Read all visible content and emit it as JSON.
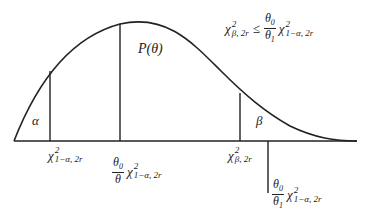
{
  "diagram": {
    "type": "probability-density-curve",
    "curve_label": "P(θ)",
    "regions": {
      "left_tail": "α",
      "right_tail": "β"
    },
    "condition": {
      "lhs_base": "χ",
      "lhs_sup": "2",
      "lhs_sub": "β, 2r",
      "operator": "≤",
      "frac_num": "θ",
      "frac_num_sub": "0",
      "frac_den": "θ",
      "frac_den_sub": "1",
      "rhs_base": "χ",
      "rhs_sup": "2",
      "rhs_sub": "1−α, 2r"
    },
    "axis_labels": [
      {
        "id": "chi-1-alpha",
        "base": "χ",
        "sup": "2",
        "sub": "1−α, 2r"
      },
      {
        "id": "theta0-over-theta-chi",
        "frac_num": "θ",
        "frac_num_sub": "0",
        "frac_den": "θ",
        "frac_den_sub": "",
        "base": "χ",
        "sup": "2",
        "sub": "1−α, 2r"
      },
      {
        "id": "chi-beta",
        "base": "χ",
        "sup": "2",
        "sub": "β, 2r"
      },
      {
        "id": "theta0-over-theta1-chi",
        "frac_num": "θ",
        "frac_num_sub": "0",
        "frac_den": "θ",
        "frac_den_sub": "1",
        "base": "χ",
        "sup": "2",
        "sub": "1−α, 2r"
      }
    ],
    "colors": {
      "line": "#222222",
      "background": "#ffffff"
    }
  }
}
